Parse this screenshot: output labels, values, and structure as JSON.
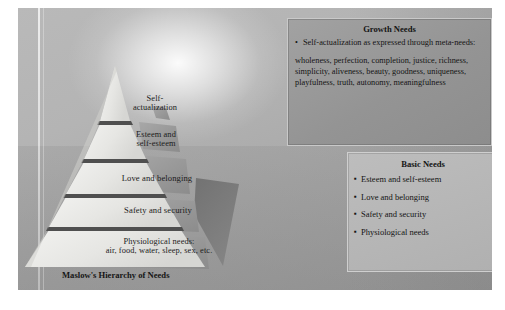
{
  "figure": {
    "caption": "Maslow's Hierarchy of Needs"
  },
  "pyramid": {
    "tiers": [
      {
        "id": "self-actualization",
        "label": "Self-\nactualization"
      },
      {
        "id": "esteem",
        "label": "Esteem and\nself-esteem"
      },
      {
        "id": "love",
        "label": "Love and belonging"
      },
      {
        "id": "safety",
        "label": "Safety and security"
      },
      {
        "id": "physiological",
        "label": "Physiological needs:\nair, food, water, sleep, sex, etc."
      }
    ]
  },
  "growth_needs": {
    "title": "Growth Needs",
    "bullet": "•",
    "point": "Self-actualization as expressed through meta-needs:",
    "meta_needs": "wholeness, perfection, completion, justice, richness, simplicity, aliveness, beauty, goodness, uniqueness, playfulness, truth, autonomy, meaningfulness"
  },
  "basic_needs": {
    "title": "Basic Needs",
    "bullet": "▪",
    "items": [
      "Esteem and self-esteem",
      "Love and belonging",
      "Safety and security",
      "Physiological needs"
    ]
  },
  "colors": {
    "plate_light": "#b9b9b9",
    "plate_dark": "#9d9d9d",
    "tier_face": "#e8e8e6",
    "tier_divider": "#5f5f5f",
    "side_face": "#9a9a9a",
    "shadow": "#707070",
    "growth_box": "#949494",
    "basic_box": "#b3b3b3",
    "text": "#141414"
  }
}
